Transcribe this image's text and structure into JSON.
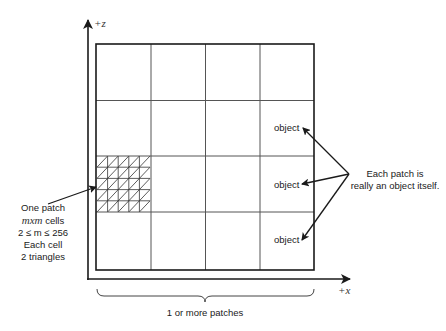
{
  "diagram": {
    "axes": {
      "z_label": "+z",
      "x_label": "+x"
    },
    "grid": {
      "rows": 4,
      "cols": 4,
      "highlighted_patch": {
        "row": 2,
        "col": 0,
        "subdivisions": 5
      }
    },
    "left_note": {
      "line1": "One patch",
      "line2_var": "mxm",
      "line2_rest": " cells",
      "line3": "2 ≤ m ≤ 256",
      "line4": "Each cell",
      "line5": "2 triangles"
    },
    "object_labels": [
      "object",
      "object",
      "object"
    ],
    "right_note": {
      "line1": "Each patch is",
      "line2": "really an object itself."
    },
    "brace_label": "1 or more patches",
    "colors": {
      "line": "#1a1a1a",
      "grid": "#555555",
      "background": "#ffffff"
    }
  }
}
